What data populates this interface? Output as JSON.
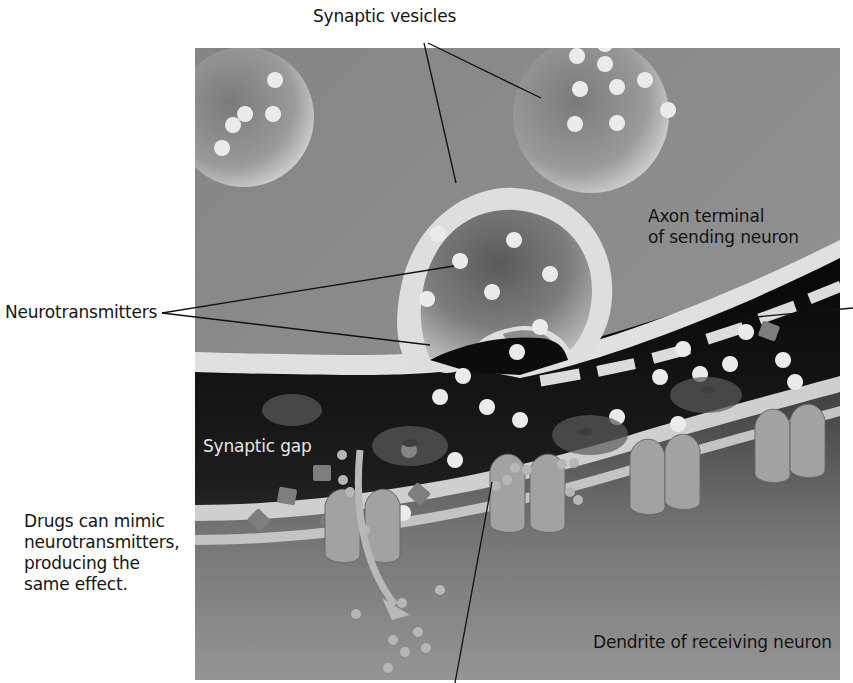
{
  "figure": {
    "type": "synapse-illustration",
    "palette": {
      "background": "#ffffff",
      "axon_fill": "#8a8a8a",
      "membrane": "#e2e2e2",
      "cleft_dark": "#0d0d0d",
      "dendrite_fill": "#8f8f8f",
      "vesicle_fill": "#9a9a9a",
      "neurotransmitter": "#ececec",
      "receptor": "#9c9c9c",
      "leader_line": "#111111"
    },
    "labels": {
      "synaptic_vesicles": "Synaptic vesicles",
      "axon_terminal_line1": "Axon terminal",
      "axon_terminal_line2": "of sending neuron",
      "neurotransmitters": "Neurotransmitters",
      "synaptic_gap": "Synaptic gap",
      "drugs_line1": "Drugs can mimic",
      "drugs_line2": "neurotransmitters,",
      "drugs_line3": "producing the",
      "drugs_line4": "same effect.",
      "dendrite": "Dendrite of receiving neuron"
    }
  }
}
